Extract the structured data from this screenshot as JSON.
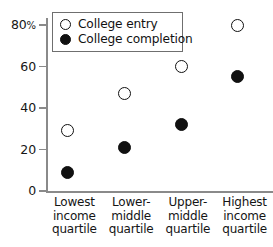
{
  "chart_data": {
    "type": "scatter",
    "title": "",
    "xlabel": "",
    "ylabel": "",
    "ylim": [
      0,
      88
    ],
    "grid": false,
    "legend_position": "top-left-inside",
    "categories": [
      "Lowest income quartile",
      "Lower-middle quartile",
      "Upper-middle quartile",
      "Highest income quartile"
    ],
    "category_lines": [
      [
        "Lowest",
        "income",
        "quartile"
      ],
      [
        "Lower-",
        "middle",
        "quartile"
      ],
      [
        "Upper-",
        "middle",
        "quartile"
      ],
      [
        "Highest",
        "income",
        "quartile"
      ]
    ],
    "yticks": [
      0,
      20,
      40,
      60,
      80
    ],
    "ytick_labels": [
      "0",
      "20",
      "40",
      "60",
      "80%"
    ],
    "series": [
      {
        "name": "College entry",
        "marker": "open-circle",
        "color": "#111111",
        "values": [
          29,
          47,
          60,
          80
        ]
      },
      {
        "name": "College completion",
        "marker": "filled-circle",
        "color": "#111111",
        "values": [
          9,
          21,
          32,
          55
        ]
      }
    ]
  },
  "legend": {
    "items": [
      {
        "label": "College entry",
        "marker": "open-circle"
      },
      {
        "label": "College completion",
        "marker": "filled-circle"
      }
    ]
  },
  "colors": {
    "marker": "#111111",
    "axis": "#8a8a8a",
    "legend_border": "#6f6f6f",
    "background": "#ffffff",
    "text": "#151515"
  }
}
